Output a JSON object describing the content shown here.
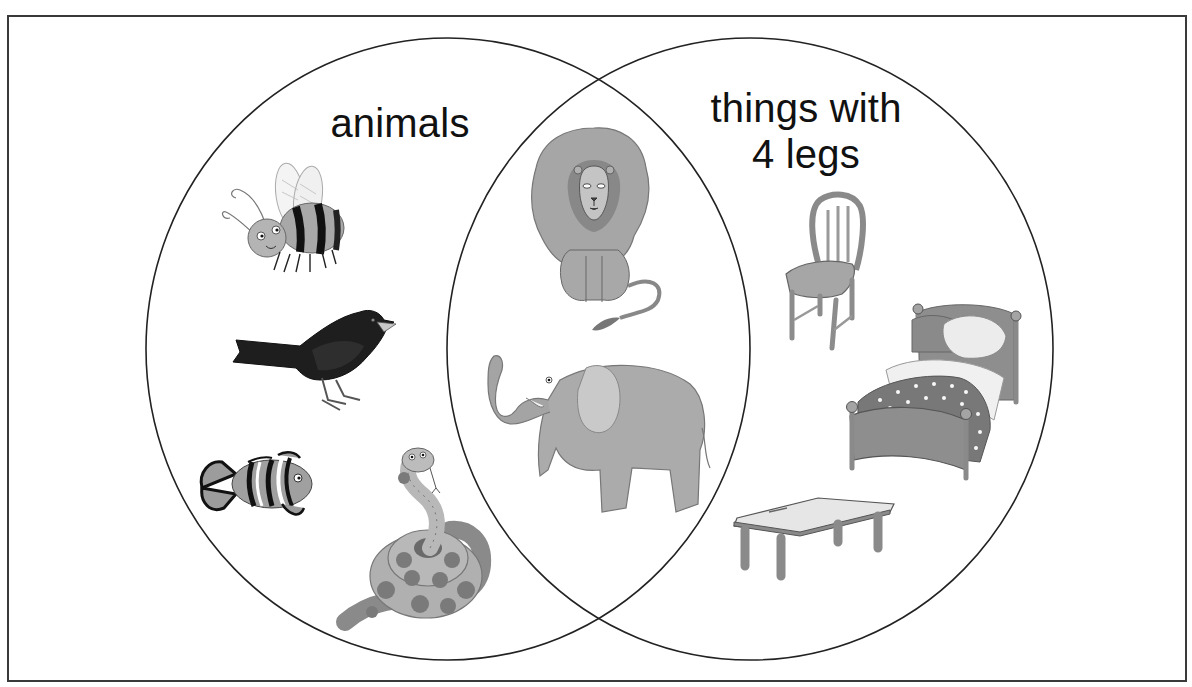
{
  "diagram": {
    "type": "venn",
    "sets": [
      {
        "id": "left",
        "label": "animals",
        "items": [
          "bee",
          "blackbird",
          "clownfish",
          "snake"
        ]
      },
      {
        "id": "right",
        "label": "things with\n4 legs",
        "label_lines": [
          "things with",
          "4 legs"
        ],
        "items": [
          "chair",
          "bed",
          "table"
        ]
      }
    ],
    "intersection": {
      "items": [
        "lion",
        "elephant"
      ]
    },
    "colors": {
      "outline": "#222222",
      "frame": "#3a3a3a",
      "background": "#ffffff",
      "gray_light": "#bdbdbd",
      "gray_mid": "#9a9a9a",
      "gray_dark": "#6e6e6e",
      "black_bird": "#1e1e1e"
    }
  }
}
